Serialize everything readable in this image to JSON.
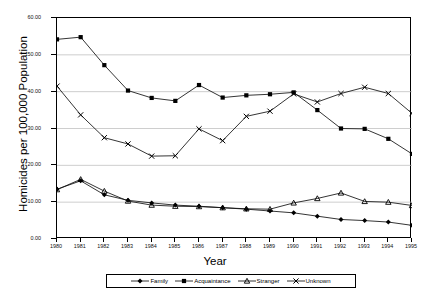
{
  "chart_data": {
    "type": "line",
    "title": "",
    "xlabel": "Year",
    "ylabel": "Homicides per 100,000 Population",
    "x": [
      1980,
      1981,
      1982,
      1983,
      1984,
      1985,
      1986,
      1987,
      1988,
      1989,
      1990,
      1991,
      1992,
      1993,
      1994,
      1995
    ],
    "categories": [
      "1980",
      "1981",
      "1982",
      "1983",
      "1984",
      "1985",
      "1986",
      "1987",
      "1988",
      "1989",
      "1990",
      "1991",
      "1992",
      "1993",
      "1994",
      "1995"
    ],
    "xlim": [
      1980,
      1995
    ],
    "ylim": [
      0.0,
      60.0
    ],
    "yticks": [
      0.0,
      10.0,
      20.0,
      30.0,
      40.0,
      50.0,
      60.0
    ],
    "ytick_labels": [
      "0.00",
      "10.00",
      "20.00",
      "30.00",
      "40.00",
      "50.00",
      "60.00"
    ],
    "grid": "horizontal",
    "legend_position": "below-axis",
    "series": [
      {
        "name": "Family",
        "marker": "diamond",
        "values": [
          13.5,
          15.8,
          12.0,
          10.5,
          9.8,
          9.2,
          8.9,
          8.5,
          8.1,
          7.6,
          7.1,
          6.2,
          5.3,
          5.0,
          4.6,
          3.7
        ]
      },
      {
        "name": "Acquaintance",
        "marker": "square",
        "values": [
          54.2,
          54.8,
          47.2,
          40.3,
          38.3,
          37.5,
          41.8,
          38.4,
          39.0,
          39.3,
          39.8,
          35.0,
          30.0,
          29.9,
          27.2,
          23.1
        ]
      },
      {
        "name": "Stranger",
        "marker": "triangle",
        "values": [
          13.4,
          16.2,
          13.0,
          10.3,
          9.2,
          8.9,
          8.8,
          8.5,
          8.2,
          8.1,
          9.8,
          11.0,
          12.5,
          10.2,
          10.0,
          9.1
        ]
      },
      {
        "name": "Unknown",
        "marker": "cross",
        "values": [
          41.5,
          33.7,
          27.5,
          25.8,
          22.5,
          22.6,
          29.9,
          26.7,
          33.3,
          34.7,
          39.4,
          37.2,
          39.5,
          41.2,
          39.5,
          34.1
        ]
      }
    ]
  },
  "legend": {
    "items": [
      {
        "label": "Family",
        "marker": "diamond"
      },
      {
        "label": "Acquaintance",
        "marker": "square"
      },
      {
        "label": "Stranger",
        "marker": "triangle"
      },
      {
        "label": "Unknown",
        "marker": "cross"
      }
    ]
  },
  "axis": {
    "x_title": "Year",
    "y_title": "Homicides per 100,000 Population"
  }
}
